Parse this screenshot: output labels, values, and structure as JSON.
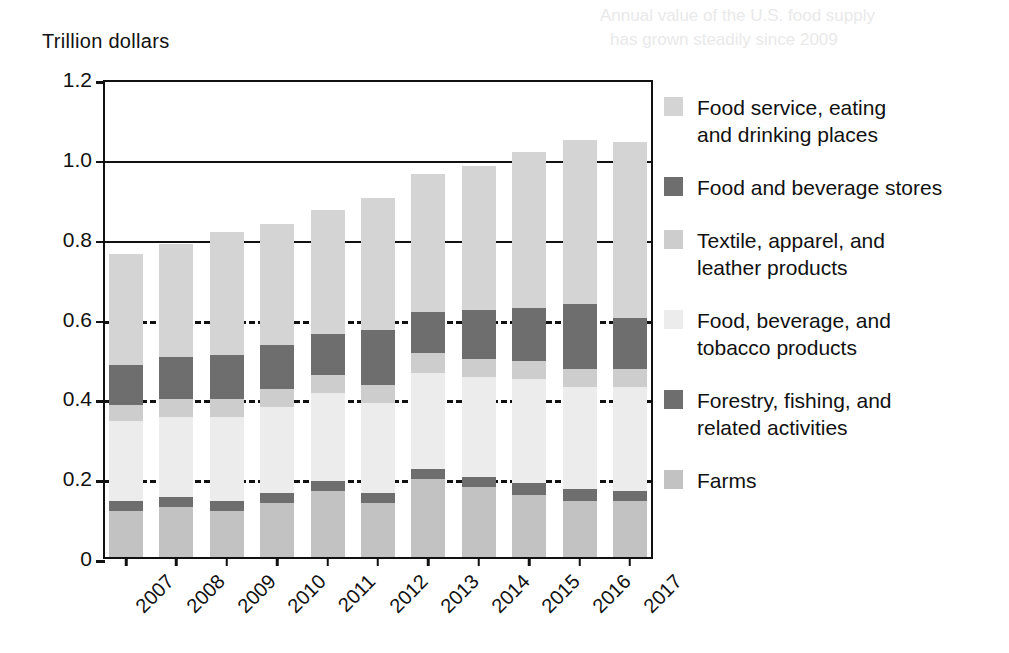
{
  "chart_data": {
    "type": "bar",
    "subtype": "stacked-vertical",
    "title": "",
    "xlabel": "",
    "ylabel": "Trillion dollars",
    "ylim": [
      0,
      1.2
    ],
    "yticks": [
      0,
      0.2,
      0.4,
      0.6,
      0.8,
      1.0,
      1.2
    ],
    "ytick_labels": [
      "0",
      "0.2",
      "0.4",
      "0.6",
      "0.8",
      "1.0",
      "1.2"
    ],
    "grid": true,
    "legend_position": "right",
    "categories": [
      "2007",
      "2008",
      "2009",
      "2010",
      "2011",
      "2012",
      "2013",
      "2014",
      "2015",
      "2016",
      "2017"
    ],
    "series": [
      {
        "name": "Farms",
        "color": "#c2c2c2",
        "values": [
          0.115,
          0.125,
          0.115,
          0.135,
          0.165,
          0.135,
          0.195,
          0.175,
          0.155,
          0.14,
          0.14
        ]
      },
      {
        "name": "Forestry, fishing, and related activities",
        "color": "#6e6e6e",
        "values": [
          0.025,
          0.025,
          0.025,
          0.025,
          0.025,
          0.025,
          0.025,
          0.025,
          0.03,
          0.03,
          0.025
        ]
      },
      {
        "name": "Food, beverage, and tobacco products",
        "color": "#ececec",
        "values": [
          0.2,
          0.2,
          0.21,
          0.215,
          0.22,
          0.225,
          0.24,
          0.25,
          0.26,
          0.255,
          0.26
        ]
      },
      {
        "name": "Textile, apparel, and leather products",
        "color": "#cdcdcd",
        "values": [
          0.04,
          0.045,
          0.045,
          0.045,
          0.045,
          0.045,
          0.05,
          0.045,
          0.045,
          0.045,
          0.045
        ]
      },
      {
        "name": "Food and beverage stores",
        "color": "#6e6e6e",
        "values": [
          0.1,
          0.105,
          0.11,
          0.11,
          0.105,
          0.14,
          0.105,
          0.125,
          0.135,
          0.165,
          0.13
        ]
      },
      {
        "name": "Food service, eating and drinking places",
        "color": "#d4d4d4",
        "values": [
          0.28,
          0.285,
          0.31,
          0.305,
          0.31,
          0.33,
          0.345,
          0.36,
          0.39,
          0.41,
          0.44
        ]
      }
    ],
    "totals": [
      0.76,
      0.785,
      0.815,
      0.835,
      0.87,
      0.9,
      0.96,
      0.98,
      1.02,
      1.05,
      1.04
    ]
  },
  "legend": {
    "items": [
      {
        "label": "Food service, eating\nand drinking places",
        "color": "#d4d4d4",
        "icon": "legend-swatch-icon"
      },
      {
        "label": "Food and beverage stores",
        "color": "#6e6e6e",
        "icon": "legend-swatch-icon"
      },
      {
        "label": "Textile, apparel, and\nleather products",
        "color": "#cdcdcd",
        "icon": "legend-swatch-icon"
      },
      {
        "label": "Food, beverage, and\ntobacco products",
        "color": "#ececec",
        "icon": "legend-swatch-icon"
      },
      {
        "label": "Forestry, fishing, and\nrelated activities",
        "color": "#6e6e6e",
        "icon": "legend-swatch-icon"
      },
      {
        "label": "Farms",
        "color": "#c2c2c2",
        "icon": "legend-swatch-icon"
      }
    ]
  },
  "axis": {
    "y_title": "Trillion  dollars"
  }
}
